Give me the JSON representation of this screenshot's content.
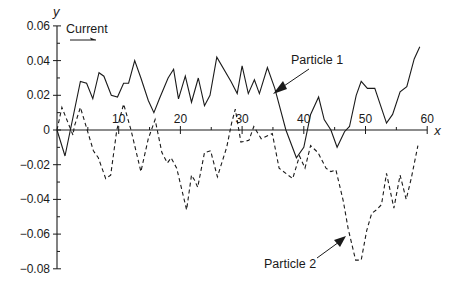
{
  "chart_data": {
    "type": "line",
    "title": "",
    "xlabel": "x",
    "ylabel": "y",
    "xlim": [
      0,
      60
    ],
    "ylim": [
      -0.08,
      0.06
    ],
    "x_ticks": [
      10,
      20,
      30,
      40,
      50,
      60
    ],
    "x_tick_labels": [
      "10",
      "20",
      "30",
      "40",
      "50",
      "60"
    ],
    "x_minor_step": 5,
    "y_ticks": [
      0.06,
      0.04,
      0.02,
      0,
      -0.02,
      -0.04,
      -0.06,
      -0.08
    ],
    "y_tick_labels": [
      "0.06",
      "0.04",
      "0.02",
      "0",
      "−0.02",
      "−0.04",
      "−0.06",
      "−0.08"
    ],
    "y_minor_step": 0.01,
    "grid": false,
    "legend": null,
    "annotations": [
      {
        "text": "Current",
        "type": "arrow-right",
        "position": "top-left"
      },
      {
        "text": "Particle 1",
        "points_to_series": "Particle 1",
        "at_x": 35.3
      },
      {
        "text": "Particle 2",
        "points_to_series": "Particle 2",
        "at_x": 47.2
      }
    ],
    "series": [
      {
        "name": "Particle 1",
        "style": "solid",
        "x": [
          0,
          1.3,
          3.8,
          4.8,
          5.8,
          6.8,
          7.6,
          8.8,
          9.8,
          10.8,
          11.6,
          12.6,
          13.6,
          14.8,
          15.7,
          16.6,
          18.0,
          18.9,
          19.7,
          20.8,
          21.8,
          22.9,
          23.9,
          24.8,
          25.9,
          28.2,
          29.2,
          30.0,
          31.0,
          32.0,
          32.8,
          34.1,
          35.3,
          37.1,
          38.8,
          40.0,
          41.1,
          42.4,
          43.3,
          44.4,
          45.4,
          46.6,
          47.4,
          48.5,
          49.3,
          50.3,
          51.5,
          53.4,
          54.4,
          55.6,
          56.7,
          57.9,
          58.8
        ],
        "y": [
          0,
          -0.015,
          0.028,
          0.027,
          0.018,
          0.033,
          0.031,
          0.02,
          0.019,
          0.027,
          0.027,
          0.04,
          0.03,
          0.017,
          0.01,
          0.018,
          0.03,
          0.035,
          0.018,
          0.031,
          0.016,
          0.03,
          0.014,
          0.02,
          0.042,
          0.028,
          0.021,
          0.037,
          0.021,
          0.029,
          0.021,
          0.036,
          0.024,
          0.0,
          -0.016,
          -0.01,
          0.009,
          0.019,
          0.006,
          0.0,
          -0.01,
          -0.001,
          0.002,
          0.02,
          0.028,
          0.024,
          0.024,
          0.004,
          0.009,
          0.022,
          0.025,
          0.041,
          0.048
        ]
      },
      {
        "name": "Particle 2",
        "style": "dashed",
        "x": [
          0,
          0.8,
          2.6,
          2.8,
          3.8,
          4.9,
          5.9,
          6.7,
          7.9,
          8.7,
          9.7,
          10.8,
          12.0,
          13.6,
          14.8,
          15.9,
          17.0,
          17.9,
          18.5,
          19.4,
          21.0,
          21.8,
          22.3,
          22.8,
          23.9,
          24.9,
          26.0,
          27.5,
          28.3,
          28.9,
          29.8,
          31.1,
          31.9,
          33.1,
          34.9,
          36.0,
          38.2,
          39.3,
          40.2,
          41.1,
          42.3,
          43.6,
          44.4,
          45.2,
          46.4,
          47.2,
          48.4,
          49.3,
          50.2,
          51.0,
          51.8,
          52.6,
          53.4,
          54.6,
          55.6,
          56.6,
          57.4,
          58.5
        ],
        "y": [
          0,
          0.013,
          -0.003,
          0.002,
          0.013,
          0.0,
          -0.012,
          -0.016,
          -0.028,
          -0.026,
          0.0,
          0.015,
          0.0,
          -0.024,
          -0.005,
          0.006,
          -0.013,
          -0.019,
          -0.016,
          -0.022,
          -0.046,
          -0.026,
          -0.029,
          -0.033,
          -0.013,
          -0.012,
          -0.027,
          -0.01,
          0.004,
          0.012,
          -0.007,
          -0.006,
          0.002,
          -0.005,
          -0.002,
          -0.022,
          -0.028,
          -0.015,
          -0.022,
          -0.009,
          -0.013,
          -0.022,
          -0.024,
          -0.023,
          -0.041,
          -0.057,
          -0.075,
          -0.075,
          -0.058,
          -0.048,
          -0.046,
          -0.043,
          -0.025,
          -0.045,
          -0.026,
          -0.04,
          -0.028,
          -0.009
        ]
      }
    ]
  }
}
